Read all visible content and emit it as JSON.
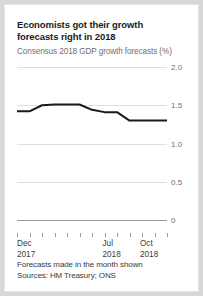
{
  "card": {
    "title_line1": "Economists got their growth",
    "title_line2": "forecasts right in 2018",
    "subtitle": "Consensus 2018 GDP growth forecasts (%)"
  },
  "footer": {
    "line1": "Forecasts made in the month shown",
    "line2": "Sources: HM Treasury; ONS"
  },
  "xlabels": [
    {
      "top": "Dec",
      "bottom": "2017"
    },
    {
      "top": "Jul",
      "bottom": "2018"
    },
    {
      "top": "Oct",
      "bottom": "2018"
    }
  ],
  "colors": {
    "line": "#1a1a1a",
    "grid": "#dfdfdf",
    "axis": "#9a9a9a",
    "text": "#3a3a3a",
    "muted": "#6f6f6f",
    "card": "#ffffff"
  },
  "chart_data": {
    "type": "line",
    "title": "Economists got their growth forecasts right in 2018",
    "subtitle": "Consensus 2018 GDP growth forecasts (%)",
    "xlabel": "",
    "ylabel": "",
    "ylim": [
      0,
      2.0
    ],
    "yticks": [
      2.0,
      1.5,
      1.0,
      0.5,
      0
    ],
    "ytick_labels": [
      "2.0",
      "1.5",
      "1.0",
      "0.5",
      "0"
    ],
    "y_axis_position": "right",
    "grid": true,
    "legend": null,
    "categories": [
      "Dec 2017",
      "Jan 2018",
      "Feb 2018",
      "Mar 2018",
      "Apr 2018",
      "May 2018",
      "Jun 2018",
      "Jul 2018",
      "Aug 2018",
      "Sep 2018",
      "Oct 2018",
      "Nov 2018",
      "Dec 2018"
    ],
    "x_tick_count": 13,
    "x_labeled_ticks": [
      "Dec 2017",
      "Jul 2018",
      "Oct 2018"
    ],
    "series": [
      {
        "name": "Consensus 2018 GDP growth forecast",
        "values": [
          1.42,
          1.42,
          1.5,
          1.51,
          1.51,
          1.51,
          1.44,
          1.41,
          1.41,
          1.3,
          1.3,
          1.3,
          1.3
        ]
      }
    ],
    "annotations": [
      "Forecasts made in the month shown",
      "Sources: HM Treasury; ONS"
    ]
  }
}
